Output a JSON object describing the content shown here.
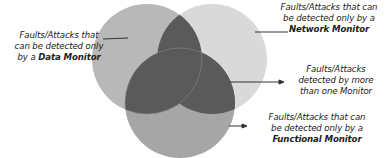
{
  "diagram": {
    "type": "venn",
    "sets": [
      {
        "name": "Data Monitor",
        "color": "#b8b8b8"
      },
      {
        "name": "Network Monitor",
        "color": "#d9d9d9"
      },
      {
        "name": "Functional Monitor",
        "color": "#a6a6a6"
      }
    ],
    "overlap_color": "#5a5a5a",
    "labels": {
      "data": {
        "line1": "Faults/Attacks that",
        "line2": "can be detected only",
        "line3_prefix": "by a ",
        "line3_bold": "Data Monitor"
      },
      "network": {
        "line1": "Faults/Attacks that can",
        "line2": "be detected only by a",
        "line3_bold": "Network Monitor"
      },
      "multi": {
        "line1": "Faults/Attacks",
        "line2": "detected by more",
        "line3": "than one Monitor"
      },
      "functional": {
        "line1": "Faults/Attacks that can",
        "line2": "be detected only by a",
        "line3_bold": "Functional Monitor"
      }
    }
  }
}
